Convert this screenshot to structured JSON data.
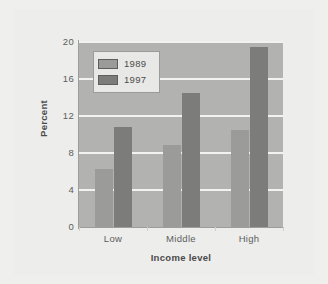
{
  "chart_data": {
    "type": "bar",
    "title": "",
    "subtitle": "",
    "xlabel": "Income level",
    "ylabel": "Percent",
    "categories": [
      "Low",
      "Middle",
      "High"
    ],
    "series": [
      {
        "name": "1989",
        "values": [
          6.3,
          8.9,
          10.5
        ],
        "color": "#9b9b99"
      },
      {
        "name": "1997",
        "values": [
          10.8,
          14.5,
          19.5
        ],
        "color": "#7c7c7b"
      }
    ],
    "ylim": [
      0,
      20
    ],
    "yticks": [
      0,
      4,
      8,
      12,
      16,
      20
    ],
    "ytick_labels": [
      "0",
      "4",
      "8",
      "12",
      "16",
      "20"
    ],
    "grid": true,
    "grid_color": "#f2f2f0",
    "legend_position": "upper-left-inside",
    "plot_background": "#b2b2b0",
    "figure_background": "#ededec",
    "page_background": "#efefee"
  }
}
